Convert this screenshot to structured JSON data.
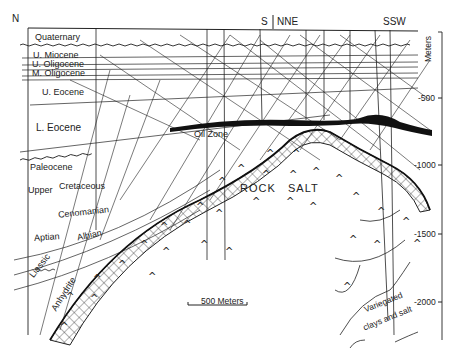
{
  "diagram": {
    "type": "geologic cross-section",
    "orientation": {
      "left": "N",
      "top_center": "S",
      "top_center_right": "NNE",
      "top_right": "SSW"
    },
    "depth_axis": {
      "unit_label": "Meters",
      "ticks": [
        "-500",
        "-1000",
        "-1500",
        "-2000"
      ]
    },
    "scale_bar": "500 Meters",
    "formations": [
      "Quaternary",
      "U. Miocene",
      "U. Oligocene",
      "M. Oligocene",
      "U. Eocene",
      "L. Eocene",
      "Paleocene",
      "Upper",
      "Cretaceous",
      "Cenomanian",
      "Aptian",
      "Albian",
      "Liassic",
      "Anhydrite"
    ],
    "features": {
      "oil_zone": "Oil Zone",
      "salt_word1": "ROCK",
      "salt_word2": "SALT",
      "variegated_1": "Variegated",
      "variegated_2": "clays and salt"
    },
    "colors": {
      "ink": "#222222",
      "background": "#ffffff"
    }
  }
}
